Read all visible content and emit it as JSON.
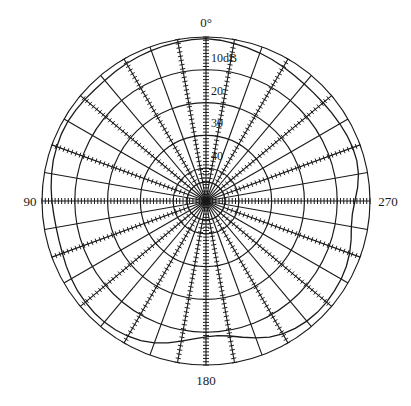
{
  "figure": {
    "title": "",
    "background_color": "#ffffff",
    "line_color": "#1a1a1a"
  },
  "chart_data": {
    "type": "line",
    "subtype": "polar-radiation-pattern",
    "title": "",
    "xlabel": "",
    "ylabel": "",
    "grid": true,
    "legend_position": "none",
    "angle_unit": "degrees",
    "angle_direction": "clockwise",
    "angle_zero_at": "top",
    "radial_unit": "dB",
    "radial_axis_label": "10dB",
    "radial_tick_labels": [
      "10dB",
      "20",
      "30",
      "40"
    ],
    "radial_tick_values": [
      10,
      20,
      30,
      40
    ],
    "radial_ring_values": [
      0,
      10,
      20,
      30,
      40
    ],
    "rlim": [
      50,
      0
    ],
    "angular_tick_labels": [
      "0°",
      "90",
      "180",
      "270"
    ],
    "angular_tick_values": [
      0,
      90,
      180,
      270
    ],
    "angular_spoke_step_deg": 10,
    "angular_spoke_count": 36,
    "series": [
      {
        "name": "pattern",
        "theta": [
          0,
          5,
          10,
          15,
          20,
          25,
          30,
          35,
          40,
          45,
          50,
          55,
          60,
          65,
          70,
          75,
          80,
          85,
          90,
          95,
          100,
          105,
          110,
          115,
          120,
          125,
          130,
          135,
          140,
          145,
          150,
          155,
          160,
          165,
          170,
          175,
          180,
          185,
          190,
          195,
          200,
          205,
          210,
          215,
          220,
          225,
          230,
          235,
          240,
          245,
          250,
          255,
          260,
          265,
          270,
          275,
          280,
          285,
          290,
          295,
          300,
          305,
          310,
          315,
          320,
          325,
          330,
          335,
          340,
          345,
          350,
          355,
          360
        ],
        "values": [
          0.5,
          0.8,
          1.2,
          1.6,
          2.0,
          2.4,
          2.8,
          3.2,
          3.4,
          3.5,
          3.4,
          3.2,
          2.9,
          2.6,
          2.4,
          2.4,
          2.8,
          3.6,
          4.6,
          5.2,
          5.0,
          4.2,
          3.4,
          2.8,
          2.4,
          2.2,
          2.0,
          2.0,
          2.2,
          2.6,
          3.2,
          4.2,
          5.6,
          7.0,
          8.2,
          8.8,
          8.6,
          7.8,
          6.6,
          5.2,
          4.0,
          3.0,
          2.4,
          2.0,
          1.8,
          1.8,
          2.0,
          2.2,
          2.6,
          3.0,
          3.4,
          3.6,
          3.6,
          3.4,
          3.0,
          2.6,
          2.2,
          1.8,
          1.6,
          1.4,
          1.4,
          1.6,
          1.8,
          2.0,
          2.0,
          1.8,
          1.6,
          1.4,
          1.2,
          1.0,
          0.8,
          0.6,
          0.5
        ]
      }
    ]
  },
  "labels": {
    "angle_top": "0°",
    "angle_left": "90",
    "angle_bottom": "180",
    "angle_right": "270",
    "radial_10": "10dB",
    "radial_20": "20",
    "radial_30": "30",
    "radial_40": "40"
  }
}
